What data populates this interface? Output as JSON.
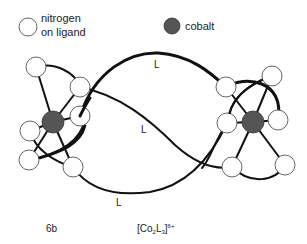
{
  "legend": {
    "nitrogen_line1": "nitrogen",
    "nitrogen_line2": "on ligand",
    "cobalt": "cobalt"
  },
  "ligand_labels": {
    "top": "L",
    "middle": "L",
    "bottom": "L"
  },
  "captions": {
    "compound_id": "6b",
    "formula_prefix": "[Co",
    "formula_sub1": "2",
    "formula_mid": "L",
    "formula_sub2": "3",
    "formula_suffix": "]",
    "formula_charge": "6+"
  },
  "colors": {
    "cobalt": "#555555",
    "nitrogen": "#ffffff",
    "strand": "#111111"
  }
}
